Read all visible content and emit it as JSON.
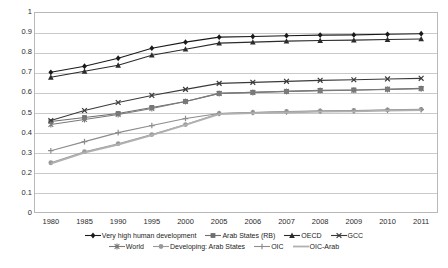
{
  "chart_data": {
    "type": "line",
    "title": "",
    "subtitle": "",
    "xlabel": "",
    "ylabel": "",
    "ylim": [
      0,
      1
    ],
    "ytick_labels": [
      "1",
      "0.9",
      "0.8",
      "0.7",
      "0.6",
      "0.5",
      "0.4",
      "0.3",
      "0.2",
      "0.1",
      "0"
    ],
    "ytick_values": [
      1,
      0.9,
      0.8,
      0.7,
      0.6,
      0.5,
      0.4,
      0.3,
      0.2,
      0.1,
      0
    ],
    "grid": true,
    "legend_position": "bottom",
    "categories": [
      "1980",
      "1985",
      "1990",
      "1995",
      "2000",
      "2005",
      "2006",
      "2007",
      "2008",
      "2009",
      "2010",
      "2011"
    ],
    "x": [
      1980,
      1985,
      1990,
      1995,
      2000,
      2005,
      2006,
      2007,
      2008,
      2009,
      2010,
      2011
    ],
    "series": [
      {
        "name": "Very high human development",
        "marker": "diamond",
        "color": "#1a1a1a",
        "values": [
          0.7,
          0.73,
          0.77,
          0.82,
          0.85,
          0.875,
          0.878,
          0.882,
          0.885,
          0.886,
          0.889,
          0.892
        ]
      },
      {
        "name": "Arab States (RB)",
        "marker": "square",
        "color": "#6e6e6e",
        "values": [
          0.455,
          0.475,
          0.495,
          0.525,
          0.555,
          0.595,
          0.6,
          0.605,
          0.61,
          0.612,
          0.616,
          0.62
        ]
      },
      {
        "name": "OECD",
        "marker": "triangle",
        "color": "#2b2b2b",
        "values": [
          0.675,
          0.705,
          0.735,
          0.785,
          0.815,
          0.845,
          0.85,
          0.855,
          0.858,
          0.86,
          0.863,
          0.866
        ]
      },
      {
        "name": "GCC",
        "marker": "cross",
        "color": "#3a3a3a",
        "values": [
          0.46,
          0.51,
          0.55,
          0.585,
          0.615,
          0.645,
          0.65,
          0.655,
          0.66,
          0.663,
          0.667,
          0.67
        ]
      },
      {
        "name": "World",
        "marker": "star",
        "color": "#7a7a7a",
        "values": [
          0.44,
          0.465,
          0.49,
          0.52,
          0.555,
          0.595,
          0.6,
          0.605,
          0.609,
          0.611,
          0.615,
          0.618
        ]
      },
      {
        "name": "Developing: Arab States",
        "marker": "circle",
        "color": "#9a9a9a",
        "values": [
          0.25,
          0.305,
          0.345,
          0.39,
          0.44,
          0.495,
          0.5,
          0.505,
          0.508,
          0.51,
          0.513,
          0.516
        ]
      },
      {
        "name": "OIC",
        "marker": "plus",
        "color": "#8c8c8c",
        "values": [
          0.31,
          0.355,
          0.4,
          0.435,
          0.47,
          0.495,
          0.5,
          0.503,
          0.506,
          0.508,
          0.511,
          0.514
        ]
      },
      {
        "name": "OIC-Arab",
        "marker": "line",
        "color": "#b0b0b0",
        "values": [
          0.245,
          0.3,
          0.34,
          0.388,
          0.438,
          0.492,
          0.497,
          0.5,
          0.504,
          0.506,
          0.509,
          0.512
        ]
      }
    ]
  },
  "legend": {
    "row1": [
      "Very high human development",
      "Arab States (RB)",
      "OECD",
      "GCC"
    ],
    "row2": [
      "World",
      "Developing: Arab States",
      "OIC",
      "OIC-Arab"
    ]
  }
}
